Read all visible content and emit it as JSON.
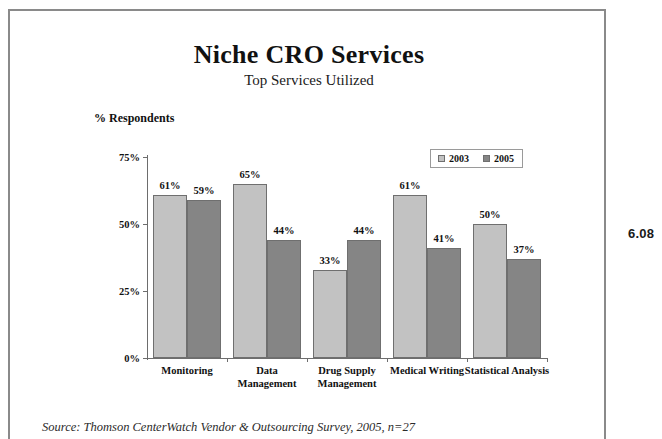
{
  "page": {
    "margin_note": "6.08",
    "source_note": "Source: Thomson CenterWatch Vendor & Outsourcing Survey, 2005, n=27"
  },
  "colors": {
    "series_2003": "#c2c2c2",
    "series_2005": "#858585",
    "axis": "#6d6d6d",
    "text": "#111111"
  },
  "chart_data": {
    "type": "bar",
    "title": "Niche CRO Services",
    "subtitle": "Top Services Utilized",
    "ylabel": "% Respondents",
    "xlabel": "",
    "ylim": [
      0,
      75
    ],
    "grid": false,
    "legend_position": "top-right",
    "yticks": [
      "0%",
      "25%",
      "50%",
      "75%"
    ],
    "ytick_values": [
      0,
      25,
      50,
      75
    ],
    "categories": [
      "Monitoring",
      "Data\nManagement",
      "Drug Supply\nManagement",
      "Medical Writing",
      "Statistical Analysis"
    ],
    "series": [
      {
        "name": "2003",
        "values": [
          61,
          65,
          33,
          61,
          50
        ],
        "labels": [
          "61%",
          "65%",
          "33%",
          "61%",
          "50%"
        ]
      },
      {
        "name": "2005",
        "values": [
          59,
          44,
          44,
          41,
          37
        ],
        "labels": [
          "59%",
          "44%",
          "44%",
          "41%",
          "37%"
        ]
      }
    ]
  }
}
